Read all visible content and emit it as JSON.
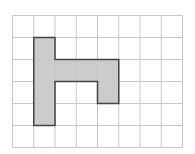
{
  "diagram": {
    "type": "grid-shape",
    "grid": {
      "columns": 8,
      "rows": 6,
      "cell_width": 21.25,
      "cell_height": 22
    },
    "colors": {
      "background": "#ffffff",
      "grid_line": "#c8c8c8",
      "shape_fill": "#cccccc",
      "shape_outline": "#444444"
    },
    "shape": {
      "name": "h-shaped-polygon",
      "cells": [
        [
          1,
          1
        ],
        [
          1,
          2
        ],
        [
          1,
          3
        ],
        [
          1,
          4
        ],
        [
          2,
          2
        ],
        [
          3,
          2
        ],
        [
          4,
          2
        ],
        [
          4,
          3
        ]
      ],
      "outline": [
        [
          1,
          1
        ],
        [
          2,
          1
        ],
        [
          2,
          2
        ],
        [
          5,
          2
        ],
        [
          5,
          4
        ],
        [
          4,
          4
        ],
        [
          4,
          3
        ],
        [
          2,
          3
        ],
        [
          2,
          5
        ],
        [
          1,
          5
        ]
      ]
    }
  }
}
